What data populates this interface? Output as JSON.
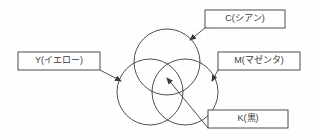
{
  "diagram": {
    "background_color": "#fefefe",
    "stroke_color": "#3a3a3a",
    "text_color": "#3a3a3a",
    "ghost_text": "色の三原色と印刷のインキの関係を示した図",
    "circles": [
      {
        "id": "cyan",
        "name": "C",
        "cx": 167,
        "cy": 62,
        "r": 33
      },
      {
        "id": "yellow",
        "name": "Y",
        "cx": 150,
        "cy": 92,
        "r": 33
      },
      {
        "id": "magenta",
        "name": "M",
        "cx": 185,
        "cy": 92,
        "r": 33
      }
    ],
    "callouts": [
      {
        "id": "c",
        "label": "C(シアン)",
        "letter": "C",
        "reading": "シアン",
        "box": {
          "x": 205,
          "y": 10,
          "w": 80,
          "h": 18
        },
        "leader": {
          "x1": 205,
          "y1": 28,
          "x2": 190,
          "y2": 40
        }
      },
      {
        "id": "y",
        "label": "Y(イエロー)",
        "letter": "Y",
        "reading": "イエロー",
        "box": {
          "x": 18,
          "y": 52,
          "w": 82,
          "h": 18
        },
        "leader": {
          "x1": 100,
          "y1": 70,
          "x2": 121,
          "y2": 81
        }
      },
      {
        "id": "m",
        "label": "M(マゼンタ)",
        "letter": "M",
        "reading": "マゼンタ",
        "box": {
          "x": 218,
          "y": 52,
          "w": 82,
          "h": 18
        },
        "leader": {
          "x1": 218,
          "y1": 70,
          "x2": 212,
          "y2": 81
        }
      },
      {
        "id": "k",
        "label": "K(黒)",
        "letter": "K",
        "reading": "黒",
        "box": {
          "x": 208,
          "y": 110,
          "w": 80,
          "h": 18
        },
        "leader": {
          "x1": 208,
          "y1": 128,
          "x2": 167,
          "y2": 78
        }
      }
    ]
  }
}
